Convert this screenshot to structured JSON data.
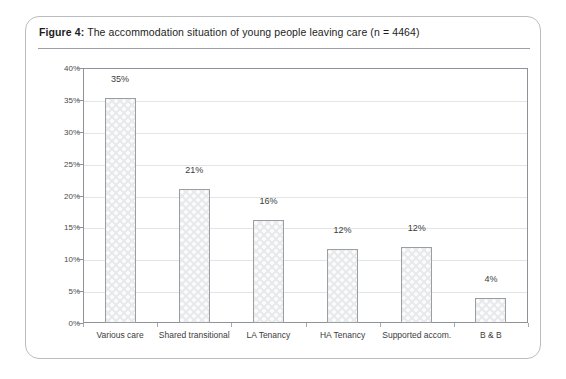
{
  "figure": {
    "label": "Figure 4:",
    "caption": " The accommodation situation of young people leaving care (n = 4464)"
  },
  "chart_data": {
    "type": "bar",
    "title": "The accommodation situation of young people leaving care (n = 4464)",
    "categories": [
      "Various care",
      "Shared transitional",
      "LA Tenancy",
      "HA Tenancy",
      "Supported accom.",
      "B & B"
    ],
    "values": [
      35,
      21,
      16,
      12,
      12,
      4
    ],
    "value_labels": [
      "35%",
      "21%",
      "16%",
      "12%",
      "12%",
      "4%"
    ],
    "bar_fractions": [
      35.3,
      21.0,
      16.1,
      11.6,
      12.0,
      3.9
    ],
    "xlabel": "",
    "ylabel": "",
    "ylim": [
      0,
      40
    ],
    "ytick_values": [
      0,
      5,
      10,
      15,
      20,
      25,
      30,
      35,
      40
    ],
    "ytick_labels": [
      "0%",
      "5%",
      "10%",
      "15%",
      "20%",
      "25%",
      "30%",
      "35%",
      "40%"
    ],
    "grid": true,
    "legend": false,
    "sample_size": 4464,
    "colors": {
      "bar_fill": "#e9eaec",
      "bar_border": "#9b9ea2",
      "gridline": "#e2e4e6",
      "axis": "#8f9296",
      "text": "#3c3c3c",
      "frame": "#b9bcc0"
    }
  }
}
